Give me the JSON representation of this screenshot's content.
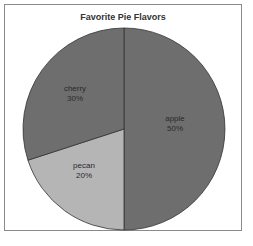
{
  "chart_data": {
    "type": "pie",
    "title": "Favorite Pie Flavors",
    "categories": [
      "apple",
      "pecan",
      "cherry"
    ],
    "values": [
      50,
      20,
      30
    ],
    "labels": [
      {
        "name": "apple",
        "pct": "50%"
      },
      {
        "name": "pecan",
        "pct": "20%"
      },
      {
        "name": "cherry",
        "pct": "30%"
      }
    ],
    "colors": [
      "#6e6e6e",
      "#b5b5b5",
      "#6e6e6e"
    ],
    "start_angle": "12 o'clock, clockwise",
    "legend": "none"
  }
}
